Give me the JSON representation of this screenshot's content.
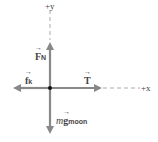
{
  "diagram": {
    "type": "free-body-diagram",
    "axes": {
      "y_label": "+y",
      "x_label": "+x"
    },
    "forces": [
      {
        "id": "normal",
        "symbol": "F",
        "subscript": "N",
        "direction": "up"
      },
      {
        "id": "friction",
        "symbol": "f",
        "subscript": "k",
        "direction": "left"
      },
      {
        "id": "tension",
        "symbol": "T",
        "subscript": "",
        "direction": "right"
      },
      {
        "id": "weight",
        "prefix": "m",
        "symbol": "g",
        "subscript": "moon",
        "direction": "down"
      }
    ],
    "colors": {
      "arrow": "#888888",
      "axis_dash": "#aaaaaa",
      "origin": "#111111",
      "text": "#444444"
    }
  }
}
